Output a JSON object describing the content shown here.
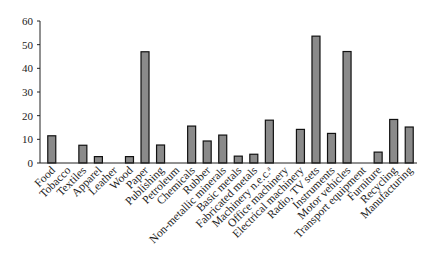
{
  "chart_data": {
    "type": "bar",
    "title": "",
    "xlabel": "",
    "ylabel": "",
    "ylim": [
      0,
      60
    ],
    "yticks": [
      0,
      10,
      20,
      30,
      40,
      50,
      60
    ],
    "grid": false,
    "legend": null,
    "categories": [
      "Food",
      "Tobacco",
      "Textiles",
      "Apparel",
      "Leather",
      "Wood",
      "Paper",
      "Publishing",
      "Petroleum",
      "Chemicals",
      "Rubber",
      "Non-metallic minerals",
      "Basic metals",
      "Fabricated metals",
      "Machinery n.e.c.ᵃ",
      "Office machinery",
      "Electrical machinery",
      "Radio, TV sets",
      "Instruments",
      "Motor vehicles",
      "Transport equipment",
      "Furniture",
      "Recycling",
      "Manufacturing"
    ],
    "values": [
      11.5,
      null,
      7.5,
      2.7,
      null,
      2.7,
      47.0,
      7.6,
      null,
      15.6,
      9.3,
      11.8,
      2.9,
      3.7,
      18.1,
      null,
      14.2,
      53.6,
      12.5,
      47.1,
      null,
      4.6,
      18.4,
      15.2
    ],
    "colors": {
      "bar_fill": "#8a8a8a",
      "bar_stroke": "#111111",
      "axis": "#222222"
    }
  }
}
